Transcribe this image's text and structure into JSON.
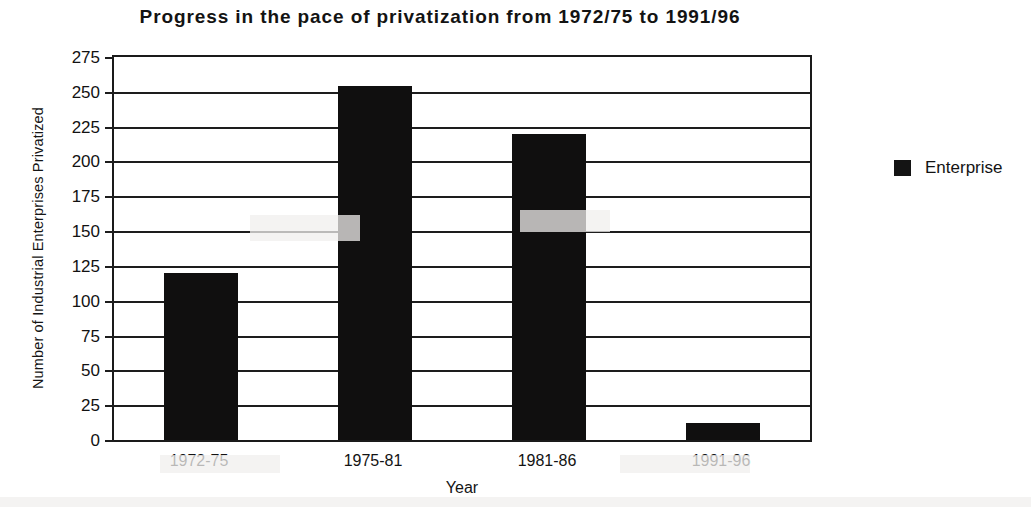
{
  "chart_data": {
    "type": "bar",
    "title": "Progress in the pace of privatization from 1972/75 to 1991/96",
    "xlabel": "Year",
    "ylabel": "Number of Industrial Enterprises Privatized",
    "categories": [
      "1972-75",
      "1975-81",
      "1981-86",
      "1991-96"
    ],
    "values": [
      120,
      254,
      220,
      12
    ],
    "series": [
      {
        "name": "Enterprise",
        "color": "#100f0f",
        "values": [
          120,
          254,
          220,
          12
        ]
      }
    ],
    "ylim": [
      0,
      275
    ],
    "ytick_step": 25,
    "ytick_labels": [
      "0",
      "25",
      "50",
      "75",
      "100",
      "125",
      "150",
      "175",
      "200",
      "225",
      "250",
      "275"
    ],
    "grid": true,
    "grid_axis": "y",
    "legend": {
      "position": "right",
      "entries": [
        {
          "label": "Enterprise",
          "color": "#100f0f",
          "marker": "square"
        }
      ]
    }
  }
}
